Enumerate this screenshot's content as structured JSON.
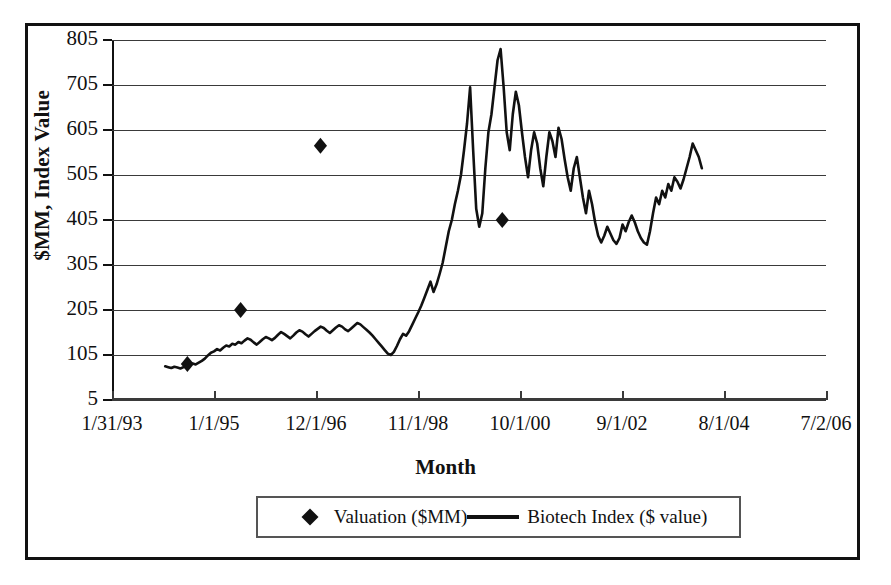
{
  "chart_data": {
    "type": "line",
    "title": "",
    "xlabel": "Month",
    "ylabel": "$MM, Index Value",
    "ylim": [
      5,
      805
    ],
    "yticks": [
      5,
      105,
      205,
      305,
      405,
      505,
      605,
      705,
      805
    ],
    "xticks": [
      "1/31/93",
      "1/1/95",
      "12/1/96",
      "11/1/98",
      "10/1/00",
      "9/1/02",
      "8/1/04",
      "7/2/06"
    ],
    "grid": "horizontal",
    "legend_position": "bottom",
    "series": [
      {
        "name": "Valuation ($MM)",
        "type": "scatter",
        "marker": "diamond",
        "color": "#111111",
        "points": [
          {
            "x": "6/1/94",
            "y": 85
          },
          {
            "x": "6/1/95",
            "y": 205
          },
          {
            "x": "12/1/96",
            "y": 570
          },
          {
            "x": "5/1/00",
            "y": 405
          }
        ]
      },
      {
        "name": "Biotech Index ($ value)",
        "type": "line",
        "color": "#111111",
        "values": [
          80,
          78,
          76,
          79,
          77,
          75,
          78,
          80,
          83,
          86,
          84,
          88,
          92,
          97,
          104,
          110,
          113,
          118,
          115,
          121,
          126,
          124,
          130,
          128,
          134,
          131,
          137,
          142,
          139,
          133,
          128,
          134,
          140,
          145,
          142,
          138,
          143,
          150,
          156,
          152,
          147,
          142,
          148,
          155,
          160,
          157,
          151,
          146,
          152,
          158,
          163,
          168,
          165,
          159,
          154,
          160,
          166,
          171,
          168,
          162,
          158,
          164,
          170,
          176,
          173,
          167,
          161,
          155,
          148,
          140,
          132,
          124,
          116,
          108,
          105,
          112,
          125,
          140,
          152,
          148,
          158,
          172,
          186,
          200,
          215,
          232,
          250,
          268,
          245,
          262,
          285,
          310,
          345,
          380,
          405,
          440,
          470,
          505,
          560,
          620,
          700,
          560,
          430,
          390,
          420,
          520,
          600,
          640,
          700,
          760,
          785,
          700,
          600,
          560,
          640,
          690,
          660,
          600,
          545,
          500,
          560,
          600,
          575,
          520,
          480,
          545,
          600,
          580,
          545,
          610,
          585,
          540,
          500,
          470,
          520,
          545,
          500,
          455,
          420,
          470,
          440,
          400,
          370,
          355,
          370,
          390,
          375,
          360,
          352,
          365,
          395,
          380,
          400,
          415,
          400,
          380,
          365,
          355,
          350,
          380,
          420,
          455,
          440,
          470,
          455,
          485,
          470,
          500,
          490,
          475,
          495,
          520,
          545,
          575,
          560,
          545,
          520
        ],
        "start_label": "1994",
        "end_label": "2004",
        "peak_value": 785,
        "min_value": 75
      }
    ]
  },
  "legend": {
    "items": [
      {
        "label": "Valuation ($MM)",
        "marker": "diamond"
      },
      {
        "label": "Biotech Index ($ value)",
        "marker": "line"
      }
    ]
  }
}
